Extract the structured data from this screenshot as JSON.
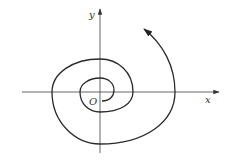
{
  "diagram": {
    "type": "phase-portrait-spiral",
    "labels": {
      "x_axis": "x",
      "y_axis": "y",
      "origin": "O"
    },
    "colors": {
      "axis": "#555555",
      "curve": "#2a2a2a",
      "background": "#ffffff"
    }
  }
}
